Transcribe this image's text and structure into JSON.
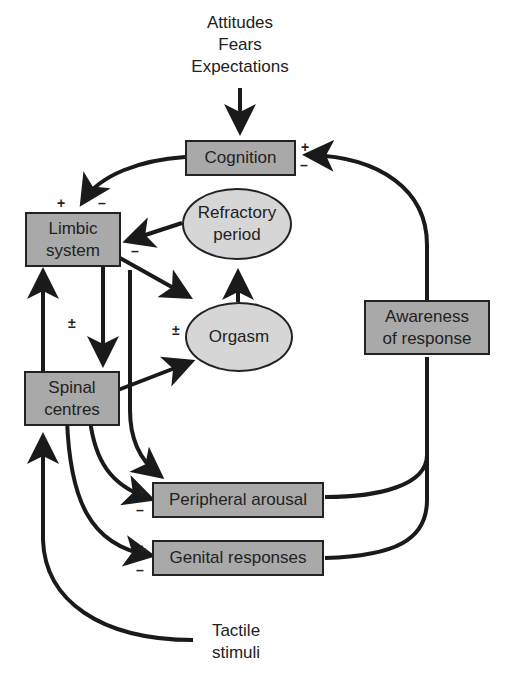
{
  "inputs": {
    "top": "Attitudes\nFears\nExpectations",
    "bottom": "Tactile\nstimuli"
  },
  "nodes": {
    "cognition": "Cognition",
    "limbic_system": "Limbic\nsystem",
    "refractory_period": "Refractory\nperiod",
    "orgasm": "Orgasm",
    "awareness_of_response": "Awareness\nof response",
    "spinal_centres": "Spinal\ncentres",
    "peripheral_arousal": "Peripheral arousal",
    "genital_responses": "Genital responses"
  },
  "signs": {
    "cognition_plus": "+",
    "cognition_minus": "–",
    "limbic_plus": "+",
    "limbic_minus": "–",
    "limbic_out_minus": "–",
    "limbic_spinal_pm": "±",
    "orgasm_pm": "±",
    "peripheral_plus": "+",
    "peripheral_minus": "–",
    "genital_plus": "+",
    "genital_minus": "–"
  },
  "colors": {
    "box_fill": "#a9a9a9",
    "ellipse_fill": "#d6d6d6",
    "stroke": "#222222"
  }
}
